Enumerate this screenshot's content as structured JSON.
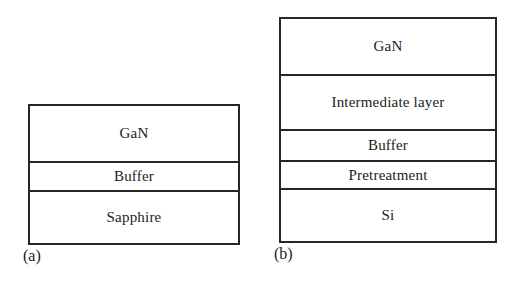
{
  "figure": {
    "caption_a": "(a)",
    "caption_b": "(b)",
    "line_color": "#262626",
    "text_color": "#1c1c1c",
    "background_color": "#ffffff"
  },
  "panels": [
    {
      "id": "a",
      "caption": "(a)",
      "layers": [
        {
          "label": "GaN"
        },
        {
          "label": "Buffer"
        },
        {
          "label": "Sapphire"
        }
      ]
    },
    {
      "id": "b",
      "caption": "(b)",
      "layers": [
        {
          "label": "GaN"
        },
        {
          "label": "Intermediate layer"
        },
        {
          "label": "Buffer"
        },
        {
          "label": "Pretreatment"
        },
        {
          "label": "Si"
        }
      ]
    }
  ]
}
